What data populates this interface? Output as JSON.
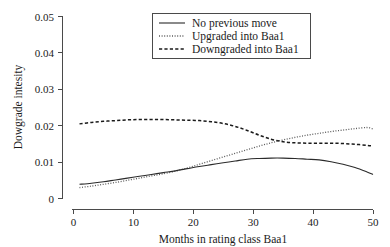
{
  "chart_data": {
    "type": "line",
    "title": "",
    "xlabel": "Months in rating class Baa1",
    "ylabel": "Dowgrade intesity",
    "xlim": [
      0,
      50
    ],
    "ylim": [
      0,
      0.05
    ],
    "grid": false,
    "legend_position": "top-center",
    "x_ticks": [
      "0",
      "10",
      "20",
      "30",
      "40",
      "50"
    ],
    "x_tick_values": [
      0,
      10,
      20,
      30,
      40,
      50
    ],
    "y_ticks": [
      "0",
      "0.01",
      "0.02",
      "0.03",
      "0.04",
      "0.05"
    ],
    "y_tick_values": [
      0,
      0.01,
      0.02,
      0.03,
      0.04,
      0.05
    ],
    "x": [
      1,
      3,
      5,
      7,
      9,
      11,
      13,
      15,
      17,
      19,
      21,
      23,
      25,
      27,
      29,
      31,
      33,
      35,
      37,
      39,
      41,
      43,
      45,
      47,
      49,
      50
    ],
    "series": [
      {
        "name": "No previous move",
        "style": "solid",
        "color": "#2b2b2b",
        "values": [
          0.0039,
          0.0042,
          0.0046,
          0.0051,
          0.0056,
          0.0061,
          0.0066,
          0.0071,
          0.0076,
          0.0082,
          0.0088,
          0.0093,
          0.0098,
          0.0103,
          0.0108,
          0.011,
          0.0111,
          0.0111,
          0.011,
          0.0108,
          0.0106,
          0.0101,
          0.0094,
          0.0085,
          0.0073,
          0.0066
        ]
      },
      {
        "name": "Upgraded into Baa1",
        "style": "dotted",
        "color": "#5a5a5a",
        "values": [
          0.003,
          0.0034,
          0.0039,
          0.0044,
          0.005,
          0.0056,
          0.0062,
          0.0068,
          0.0075,
          0.0084,
          0.0094,
          0.0104,
          0.0114,
          0.0124,
          0.0134,
          0.0144,
          0.0153,
          0.0161,
          0.0168,
          0.0174,
          0.0179,
          0.0184,
          0.0188,
          0.0192,
          0.0195,
          0.0191
        ]
      },
      {
        "name": "Downgraded into Baa1",
        "style": "dashed",
        "color": "#1a1a1a",
        "values": [
          0.0205,
          0.0209,
          0.0212,
          0.0214,
          0.0216,
          0.0217,
          0.0217,
          0.0217,
          0.0216,
          0.0215,
          0.0214,
          0.0211,
          0.0206,
          0.0198,
          0.0187,
          0.0174,
          0.0163,
          0.0156,
          0.0153,
          0.0152,
          0.0152,
          0.0152,
          0.0151,
          0.0149,
          0.0146,
          0.0144
        ]
      }
    ],
    "legend_entries": [
      {
        "label": "No previous move",
        "style": "solid"
      },
      {
        "label": "Upgraded into Baa1",
        "style": "dotted"
      },
      {
        "label": "Downgraded into Baa1",
        "style": "dashed"
      }
    ]
  }
}
